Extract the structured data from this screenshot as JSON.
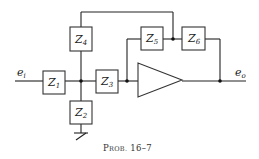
{
  "diagram": {
    "type": "circuit",
    "caption": "Prob. 16–7",
    "caption_parts": {
      "main": "P",
      "smallcaps": "ROB.",
      "number": " 16–7"
    },
    "input": {
      "symbol": "e",
      "subscript": "i"
    },
    "output": {
      "symbol": "e",
      "subscript": "o"
    },
    "components": [
      {
        "id": "Z1",
        "symbol": "Z",
        "subscript": "1"
      },
      {
        "id": "Z2",
        "symbol": "Z",
        "subscript": "2"
      },
      {
        "id": "Z3",
        "symbol": "Z",
        "subscript": "3"
      },
      {
        "id": "Z4",
        "symbol": "Z",
        "subscript": "4"
      },
      {
        "id": "Z5",
        "symbol": "Z",
        "subscript": "5"
      },
      {
        "id": "Z6",
        "symbol": "Z",
        "subscript": "6"
      }
    ],
    "amplifier": "op-amp (triangle)",
    "ground": "below Z2"
  }
}
